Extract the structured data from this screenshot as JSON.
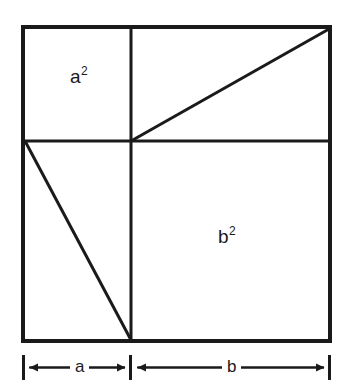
{
  "figure": {
    "type": "geometric-diagram",
    "background_color": "#ffffff",
    "stroke_color": "#1a1a1a",
    "outer_square": {
      "x": 23,
      "y": 27,
      "width": 307,
      "height": 314,
      "stroke_width": 4
    },
    "dividers": {
      "vertical_x": 131,
      "horizontal_y": 141,
      "stroke_width": 3
    },
    "diagonals": [
      {
        "name": "upper-right-diagonal",
        "x1": 131,
        "y1": 141,
        "x2": 330,
        "y2": 29,
        "stroke_width": 3
      },
      {
        "name": "lower-left-diagonal",
        "x1": 24,
        "y1": 141,
        "x2": 131,
        "y2": 340,
        "stroke_width": 3
      }
    ],
    "labels": {
      "area_a": {
        "base": "a",
        "exponent": "2"
      },
      "area_b": {
        "base": "b",
        "exponent": "2"
      }
    },
    "dimension_bar": {
      "baseline_y": 367,
      "tick_top": 355,
      "tick_bottom": 380,
      "stroke_width": 2,
      "segments": [
        {
          "name": "a",
          "label": "a",
          "from_x": 23,
          "to_x": 131
        },
        {
          "name": "b",
          "label": "b",
          "from_x": 131,
          "to_x": 330
        }
      ]
    }
  }
}
